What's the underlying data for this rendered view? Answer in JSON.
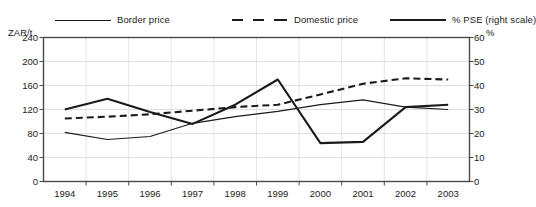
{
  "legend": {
    "items": [
      {
        "label": "Border price",
        "style": "solid-thin",
        "color": "#1b1b1b"
      },
      {
        "label": "Domestic price",
        "style": "dash",
        "color": "#1b1b1b"
      },
      {
        "label": "% PSE (right scale)",
        "style": "solid-thick",
        "color": "#1b1b1b"
      }
    ]
  },
  "axes": {
    "left_unit": "ZAR/t",
    "right_unit": "%",
    "left_ticks": [
      "240",
      "200",
      "160",
      "120",
      "80",
      "40",
      "0"
    ],
    "right_ticks": [
      "60",
      "50",
      "40",
      "30",
      "20",
      "10",
      "0"
    ]
  },
  "chart_data": {
    "type": "line",
    "title": "",
    "xlabel": "",
    "ylabel": "ZAR/t",
    "y2label": "%",
    "categories": [
      "1994",
      "1995",
      "1996",
      "1997",
      "1998",
      "1999",
      "2000",
      "2001",
      "2002",
      "2003"
    ],
    "ylim": [
      0,
      240
    ],
    "y2lim": [
      0,
      60
    ],
    "yticks": [
      0,
      40,
      80,
      120,
      160,
      200,
      240
    ],
    "y2ticks": [
      0,
      10,
      20,
      30,
      40,
      50,
      60
    ],
    "grid": true,
    "legend_position": "top",
    "series": [
      {
        "name": "Border price",
        "axis": "left",
        "style": "solid-thin",
        "color": "#1b1b1b",
        "values": [
          82,
          70,
          75,
          97,
          108,
          117,
          128,
          136,
          124,
          120
        ]
      },
      {
        "name": "Domestic price",
        "axis": "left",
        "style": "dashed",
        "color": "#1b1b1b",
        "values": [
          105,
          108,
          112,
          118,
          124,
          128,
          145,
          163,
          172,
          170
        ]
      },
      {
        "name": "% PSE (right scale)",
        "axis": "right",
        "style": "solid-thick",
        "color": "#1b1b1b",
        "values": [
          30,
          34.5,
          29,
          24,
          32,
          42.5,
          16,
          16.5,
          31,
          32
        ]
      }
    ]
  }
}
